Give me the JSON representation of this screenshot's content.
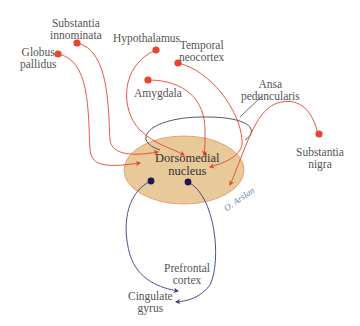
{
  "diagram": {
    "central_node": {
      "line1": "Dorsomedial",
      "line2": "nucleus",
      "fill": "#e8c99a",
      "stroke": "#f0a070"
    },
    "afferents": [
      {
        "id": "globus-pallidus",
        "line1": "Globus",
        "line2": "pallidus"
      },
      {
        "id": "substantia-innominata",
        "line1": "Substantia",
        "line2": "innominata"
      },
      {
        "id": "hypothalamus",
        "line1": "Hypothalamus",
        "line2": ""
      },
      {
        "id": "temporal-neocortex",
        "line1": "Temporal",
        "line2": "neocortex"
      },
      {
        "id": "amygdala",
        "line1": "Amygdala",
        "line2": ""
      },
      {
        "id": "substantia-nigra",
        "line1": "Substantia",
        "line2": "nigra"
      }
    ],
    "efferents": [
      {
        "id": "prefrontal-cortex",
        "line1": "Prefrontal",
        "line2": "cortex"
      },
      {
        "id": "cingulate-gyrus",
        "line1": "Cingulate",
        "line2": "gyrus"
      }
    ],
    "tract": {
      "line1": "Ansa",
      "line2": "peduncularis"
    },
    "signature": "O. Arslan",
    "colors": {
      "afferent": "#e8452c",
      "efferent": "#3a3a8c",
      "tract": "#333333"
    }
  }
}
